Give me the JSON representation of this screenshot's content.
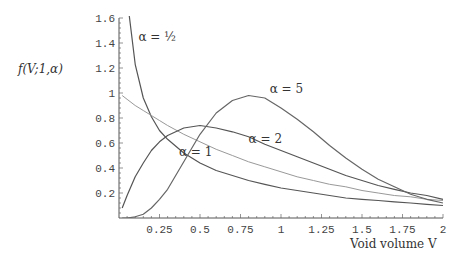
{
  "chart_data": {
    "type": "line",
    "title": "",
    "ylabel": "f(V;1,α)",
    "xlabel": "Void volume V",
    "xlim": [
      0,
      2
    ],
    "ylim": [
      0,
      1.6
    ],
    "grid": false,
    "xticks": [
      "0.25",
      "0.5",
      "0.75",
      "1",
      "1.25",
      "1.5",
      "1.75",
      "2"
    ],
    "yticks": [
      "0.2",
      "0.4",
      "0.6",
      "0.8",
      "1",
      "1.2",
      "1.4",
      "1.6"
    ],
    "x": [
      0.02,
      0.05,
      0.1,
      0.15,
      0.2,
      0.25,
      0.3,
      0.4,
      0.5,
      0.6,
      0.7,
      0.8,
      0.9,
      1.0,
      1.1,
      1.2,
      1.3,
      1.4,
      1.5,
      1.6,
      1.7,
      1.8,
      1.9,
      2.0
    ],
    "series": [
      {
        "name": "α = 1/2",
        "color": "#555555",
        "width": 1.2,
        "values": [
          2.8,
          1.76,
          1.23,
          0.96,
          0.81,
          0.7,
          0.63,
          0.52,
          0.44,
          0.38,
          0.34,
          0.3,
          0.27,
          0.24,
          0.22,
          0.2,
          0.18,
          0.16,
          0.15,
          0.14,
          0.13,
          0.12,
          0.11,
          0.1
        ]
      },
      {
        "name": "α = 1",
        "color": "#999999",
        "width": 1.0,
        "values": [
          0.98,
          0.95,
          0.9,
          0.86,
          0.82,
          0.78,
          0.74,
          0.67,
          0.61,
          0.55,
          0.5,
          0.45,
          0.41,
          0.37,
          0.33,
          0.3,
          0.27,
          0.25,
          0.22,
          0.2,
          0.18,
          0.17,
          0.15,
          0.14
        ]
      },
      {
        "name": "α = 2",
        "color": "#555555",
        "width": 1.2,
        "values": [
          0.08,
          0.18,
          0.33,
          0.44,
          0.54,
          0.61,
          0.66,
          0.72,
          0.74,
          0.72,
          0.69,
          0.65,
          0.59,
          0.54,
          0.49,
          0.44,
          0.39,
          0.34,
          0.3,
          0.26,
          0.23,
          0.2,
          0.18,
          0.15
        ]
      },
      {
        "name": "α = 5",
        "color": "#666666",
        "width": 1.2,
        "values": [
          0.0,
          0.0,
          0.01,
          0.03,
          0.08,
          0.15,
          0.23,
          0.45,
          0.67,
          0.84,
          0.94,
          0.98,
          0.96,
          0.88,
          0.79,
          0.69,
          0.58,
          0.48,
          0.39,
          0.31,
          0.25,
          0.19,
          0.15,
          0.12
        ]
      }
    ],
    "annotations": [
      {
        "text": "α = ½",
        "V": 0.12,
        "y": 1.42
      },
      {
        "text": "α = 5",
        "V": 0.93,
        "y": 1.0
      },
      {
        "text": "α = 2",
        "V": 0.8,
        "y": 0.6
      },
      {
        "text": "α = 1",
        "V": 0.37,
        "y": 0.5
      }
    ]
  }
}
